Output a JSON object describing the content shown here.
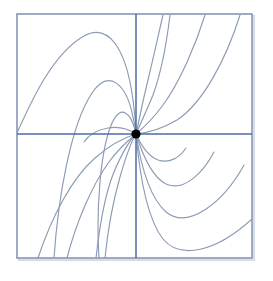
{
  "figure": {
    "type": "phase-portrait",
    "background_color": "#ffffff",
    "width": 273,
    "height": 281
  },
  "frame": {
    "name": "plot-frame",
    "x": 17,
    "y": 14,
    "width": 235,
    "height": 244,
    "stroke_color": "#7389ad",
    "stroke_width": 1.4,
    "shadow_color": "#d8dde5"
  },
  "axes": {
    "stroke_color": "#4a6da7",
    "stroke_width": 1.5,
    "x_axis": {
      "name": "horizontal-axis",
      "y": 134,
      "x_start": 17,
      "x_end": 252
    },
    "y_axis": {
      "name": "vertical-axis",
      "x": 136,
      "y_start": 14,
      "y_end": 258
    }
  },
  "origin": {
    "name": "equilibrium-point",
    "x": 136,
    "y": 134,
    "radius": 4.6,
    "fill_color": "#000000",
    "label": "origin"
  },
  "curve_style": {
    "stroke_color": "#8b9bb4",
    "stroke_width": 1.15,
    "fill": "none"
  },
  "chart_data": {
    "type": "line",
    "xlabel": "",
    "ylabel": "",
    "grid": false,
    "legend": "none",
    "xlim": [
      17,
      252
    ],
    "ylim": [
      14,
      258
    ],
    "annotations": [
      "origin node at (136,134)"
    ],
    "series": [
      {
        "name": "arch-outer-upper-left",
        "path": "M 17,133 C 30,104 52,54 84,36 C 108,23 126,47 133,100 C 135,116 136,128 136,134"
      },
      {
        "name": "arch-mid-upper-left",
        "path": "M 54,258 C 58,200 70,126 92,93 C 108,69 126,82 133,117 C 135,126 136,131 136,134"
      },
      {
        "name": "arch-inner-upper-left",
        "path": "M 99,258 C 96,212 100,150 112,123 C 121,103 131,114 135,130 C 135.6,132 136,133.4 136,134"
      },
      {
        "name": "curve-steep-upper-right-inner",
        "path": "M 136,134 C 138,126 142,104 148,80 C 154,55 159,32 163,15"
      },
      {
        "name": "curve-steep-upper-right-second",
        "path": "M 136,134 C 139,127 146,112 153,95 C 161,73 167,40 170,15"
      },
      {
        "name": "curve-upper-right-third",
        "path": "M 136,134 C 142,129 152,120 163,105 C 180,82 196,44 205,15"
      },
      {
        "name": "curve-upper-right-outer",
        "path": "M 136,134 C 146,133 160,130 177,120 C 202,104 226,60 240,15"
      },
      {
        "name": "valley-inner-lower-right-first",
        "path": "M 136,134 C 140,143 148,156 158,160 C 170,164 180,157 186,148"
      },
      {
        "name": "valley-lower-right-second",
        "path": "M 136,134 C 141,150 150,176 166,184 C 184,192 203,173 214,152"
      },
      {
        "name": "valley-lower-right-third",
        "path": "M 136,134 C 140,160 148,196 166,212 C 188,230 223,203 244,165"
      },
      {
        "name": "valley-lower-right-outer",
        "path": "M 136,134 C 139,168 145,216 163,239 C 180,260 216,252 252,219"
      },
      {
        "name": "curve-lower-left-inner",
        "path": "M 136,134 C 130,139 120,147 109,162 C 92,185 76,223 67,258"
      },
      {
        "name": "curve-lower-left-second",
        "path": "M 136,134 C 130,140 122,153 114,172 C 104,196 99,231 96,258"
      },
      {
        "name": "curve-lower-left-third",
        "path": "M 136,134 C 131,142 126,156 120,177 C 112,205 107,238 105,258"
      },
      {
        "name": "curve-lower-left-outer",
        "path": "M 136,134 C 126,137 111,144 95,158 C 72,178 52,216 38,258"
      },
      {
        "name": "valley-upper-left-near-axis",
        "path": "M 136,134 C 130,130 120,126 108,128 C 96,130 88,136 84,142"
      }
    ]
  }
}
